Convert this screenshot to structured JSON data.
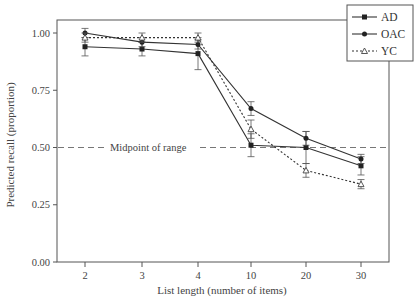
{
  "chart_data": {
    "type": "line",
    "title": "",
    "xlabel": "List length (number of items)",
    "ylabel": "Predicted recall (proportion)",
    "categories": [
      "2",
      "3",
      "4",
      "10",
      "20",
      "30"
    ],
    "y_ticks": [
      "0.00",
      "0.25",
      "0.50",
      "0.75",
      "1.00"
    ],
    "ylim": [
      0,
      1.05
    ],
    "grid": false,
    "legend_position": "top-right",
    "series": [
      {
        "name": "AD",
        "marker": "square",
        "line": "solid",
        "values": [
          0.94,
          0.93,
          0.91,
          0.51,
          0.5,
          0.42
        ],
        "err": [
          0.04,
          0.03,
          0.07,
          0.05,
          0.07,
          0.04
        ]
      },
      {
        "name": "OAC",
        "marker": "circle",
        "line": "solid",
        "values": [
          1.0,
          0.96,
          0.95,
          0.67,
          0.54,
          0.45
        ],
        "err": [
          0.02,
          0.02,
          0.02,
          0.03,
          0.03,
          0.02
        ]
      },
      {
        "name": "YC",
        "marker": "triangle",
        "line": "dotted",
        "values": [
          0.98,
          0.98,
          0.98,
          0.58,
          0.4,
          0.34
        ],
        "err": [
          0.02,
          0.02,
          0.02,
          0.04,
          0.03,
          0.02
        ]
      }
    ],
    "reference_line": {
      "y": 0.5,
      "label": "Midpoint of range",
      "style": "dashed"
    }
  },
  "axes": {
    "x_title": "List length (number of items)",
    "y_title": "Predicted recall (proportion)",
    "x_ticks": [
      "2",
      "3",
      "4",
      "10",
      "20",
      "30"
    ],
    "y_ticks": [
      "0.00",
      "0.25",
      "0.50",
      "0.75",
      "1.00"
    ]
  },
  "legend": {
    "items": [
      {
        "label": "AD",
        "marker": "square",
        "line": "solid"
      },
      {
        "label": "OAC",
        "marker": "circle",
        "line": "solid"
      },
      {
        "label": "YC",
        "marker": "triangle",
        "line": "dotted"
      }
    ]
  },
  "annotation": {
    "midpoint_label": "Midpoint of range"
  },
  "colors": {
    "line": "#333333",
    "axis": "#555555",
    "reference": "#777777"
  }
}
